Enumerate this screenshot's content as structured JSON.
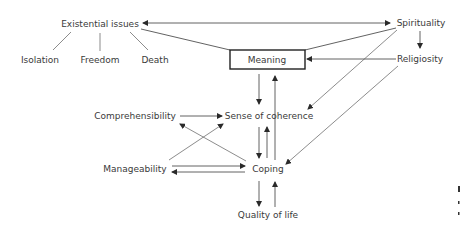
{
  "diagram": {
    "nodes": {
      "existential": {
        "label": "Existential issues",
        "x": 100,
        "y": 27
      },
      "isolation": {
        "label": "Isolation",
        "x": 40,
        "y": 63
      },
      "freedom": {
        "label": "Freedom",
        "x": 100,
        "y": 63
      },
      "death": {
        "label": "Death",
        "x": 155,
        "y": 63
      },
      "spirituality": {
        "label": "Spirituality",
        "x": 420,
        "y": 26
      },
      "meaning": {
        "label": "Meaning",
        "x": 267,
        "y": 62
      },
      "religiosity": {
        "label": "Religiosity",
        "x": 420,
        "y": 62
      },
      "comprehensibility": {
        "label": "Comprehensibility",
        "x": 134,
        "y": 119
      },
      "sense_of_coherence": {
        "label": "Sense of coherence",
        "x": 270,
        "y": 119
      },
      "manageability": {
        "label": "Manageability",
        "x": 135,
        "y": 172
      },
      "coping": {
        "label": "Coping",
        "x": 268,
        "y": 172
      },
      "quality_of_life": {
        "label": "Quality of life",
        "x": 268,
        "y": 218
      }
    },
    "edges": [
      {
        "from": "existential",
        "to": "isolation",
        "type": "line"
      },
      {
        "from": "existential",
        "to": "freedom",
        "type": "line"
      },
      {
        "from": "existential",
        "to": "death",
        "type": "line"
      },
      {
        "from": "existential",
        "to": "spirituality",
        "type": "bidirectional"
      },
      {
        "from": "existential",
        "to": "meaning",
        "type": "line"
      },
      {
        "from": "spirituality",
        "to": "meaning",
        "type": "line"
      },
      {
        "from": "spirituality",
        "to": "religiosity",
        "type": "arrow"
      },
      {
        "from": "religiosity",
        "to": "meaning",
        "type": "arrow"
      },
      {
        "from": "spirituality",
        "to": "sense_of_coherence",
        "type": "arrow"
      },
      {
        "from": "religiosity",
        "to": "coping",
        "type": "arrow"
      },
      {
        "from": "meaning",
        "to": "sense_of_coherence",
        "type": "arrow"
      },
      {
        "from": "coping",
        "to": "meaning",
        "type": "arrow"
      },
      {
        "from": "comprehensibility",
        "to": "sense_of_coherence",
        "type": "arrow"
      },
      {
        "from": "manageability",
        "to": "sense_of_coherence",
        "type": "arrow"
      },
      {
        "from": "coping",
        "to": "comprehensibility",
        "type": "arrow"
      },
      {
        "from": "sense_of_coherence",
        "to": "coping",
        "type": "arrow"
      },
      {
        "from": "coping",
        "to": "sense_of_coherence",
        "type": "arrow"
      },
      {
        "from": "manageability",
        "to": "coping",
        "type": "arrow"
      },
      {
        "from": "coping",
        "to": "manageability",
        "type": "arrow"
      },
      {
        "from": "coping",
        "to": "quality_of_life",
        "type": "arrow"
      },
      {
        "from": "quality_of_life",
        "to": "coping",
        "type": "arrow"
      }
    ]
  }
}
